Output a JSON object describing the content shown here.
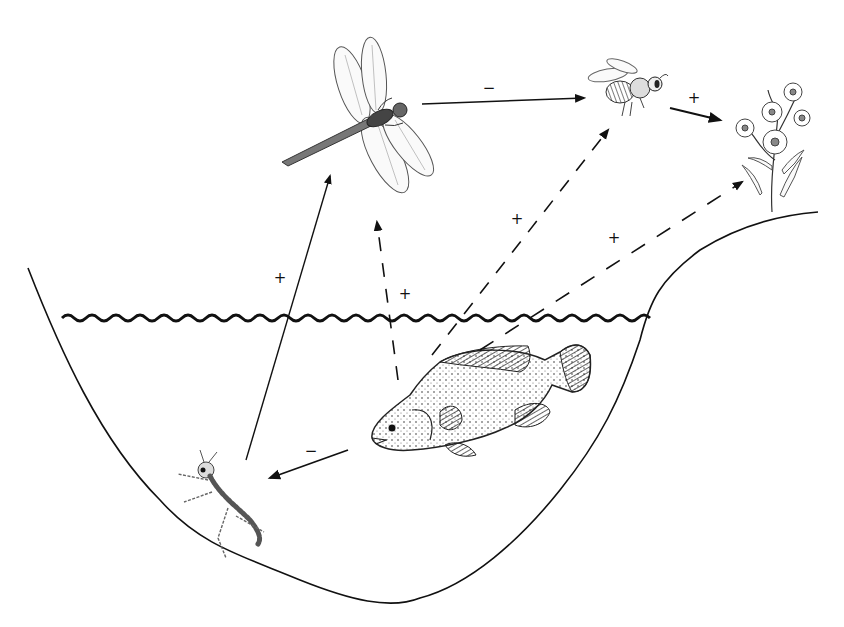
{
  "diagram": {
    "type": "ecological-interaction-web",
    "scene": "pond cross-section with surrounding bank",
    "organisms": [
      {
        "id": "dragonfly",
        "label": "Adult dragonfly",
        "position": "top center"
      },
      {
        "id": "bee",
        "label": "Bee (pollinator)",
        "position": "top right"
      },
      {
        "id": "flower",
        "label": "Flowering plant",
        "position": "right bank"
      },
      {
        "id": "fish",
        "label": "Fish",
        "position": "in water, center-right"
      },
      {
        "id": "larva",
        "label": "Dragonfly larva (nymph)",
        "position": "pond bottom, left"
      }
    ],
    "interactions": [
      {
        "from": "dragonfly",
        "to": "bee",
        "style": "solid",
        "sign": "−"
      },
      {
        "from": "bee",
        "to": "flower",
        "style": "solid",
        "sign": "+"
      },
      {
        "from": "fish",
        "to": "larva",
        "style": "solid",
        "sign": "−"
      },
      {
        "from": "larva",
        "to": "dragonfly",
        "style": "solid",
        "sign": "+"
      },
      {
        "from": "fish",
        "to": "dragonfly",
        "style": "dashed",
        "sign": "+"
      },
      {
        "from": "fish",
        "to": "bee",
        "style": "dashed",
        "sign": "+"
      },
      {
        "from": "fish",
        "to": "flower",
        "style": "dashed",
        "sign": "+"
      }
    ],
    "signs": {
      "dragonfly_bee": "−",
      "bee_flower": "+",
      "fish_larva": "−",
      "larva_dragonfly": "+",
      "fish_dragonfly": "+",
      "fish_bee": "+",
      "fish_flower": "+"
    },
    "colors": {
      "line": "#111111",
      "background": "#ffffff"
    }
  }
}
